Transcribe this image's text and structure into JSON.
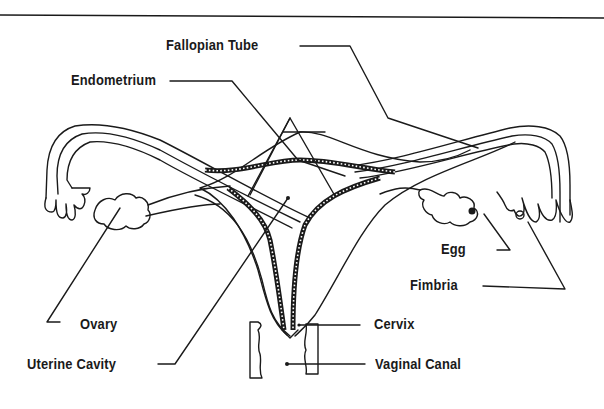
{
  "diagram": {
    "colors": {
      "ink": "#1a1a1a",
      "background": "#ffffff"
    },
    "labels": [
      {
        "id": "fallopian-tube",
        "text": "Fallopian Tube"
      },
      {
        "id": "endometrium",
        "text": "Endometrium"
      },
      {
        "id": "egg",
        "text": "Egg"
      },
      {
        "id": "fimbria",
        "text": "Fimbria"
      },
      {
        "id": "ovary",
        "text": "Ovary"
      },
      {
        "id": "cervix",
        "text": "Cervix"
      },
      {
        "id": "uterine-cavity",
        "text": "Uterine Cavity"
      },
      {
        "id": "vaginal-canal",
        "text": "Vaginal Canal"
      }
    ]
  }
}
